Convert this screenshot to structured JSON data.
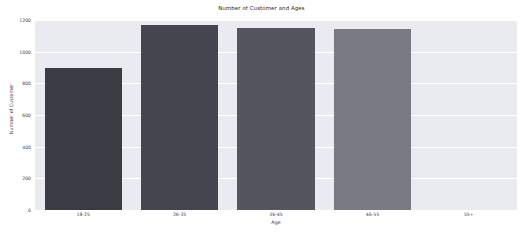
{
  "chart_data": {
    "type": "bar",
    "title": "Number of Customer and Ages",
    "xlabel": "Age",
    "ylabel": "Number of Customer",
    "categories": [
      "18-25",
      "26-35",
      "36-45",
      "46-55",
      "55+"
    ],
    "values": [
      900,
      1170,
      1150,
      1145,
      0
    ],
    "series": [
      {
        "name": "Number of Customer",
        "values": [
          900,
          1170,
          1150,
          1145,
          0
        ]
      }
    ],
    "ylim": [
      0,
      1200
    ],
    "yticks": [
      0,
      200,
      400,
      600,
      800,
      1000,
      1200
    ],
    "ytick_labels": [
      "0",
      "200",
      "400",
      "600",
      "800",
      "1000",
      "1200"
    ],
    "grid": true,
    "grid_axis": "y",
    "grid_color": "#ffffff",
    "legend": false,
    "legend_position": "none",
    "plot_background": "#eaeaf1",
    "figure_background": "#ffffff",
    "bar_colors": [
      "#3b3b44",
      "#45454f",
      "#55555f",
      "#7a7a84",
      "#eaeaf1"
    ],
    "bars": [
      {
        "category": "18-25",
        "value": 900,
        "color": "#3b3b44"
      },
      {
        "category": "26-35",
        "value": 1170,
        "color": "#45454f"
      },
      {
        "category": "36-45",
        "value": 1150,
        "color": "#55555f"
      },
      {
        "category": "46-55",
        "value": 1145,
        "color": "#7a7a84"
      },
      {
        "category": "55+",
        "value": 0,
        "color": "#eaeaf1"
      }
    ]
  }
}
